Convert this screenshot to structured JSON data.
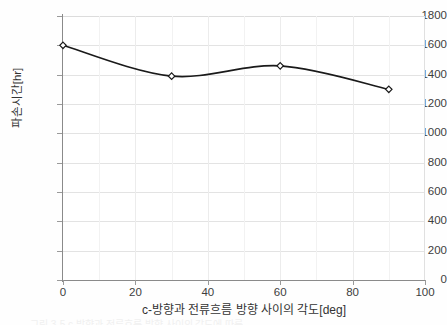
{
  "chart_data": {
    "type": "line",
    "title": "",
    "xlabel": "c-방향과 전류흐름 방향 사이의 각도[deg]",
    "ylabel": "파손시간[hr]",
    "x": [
      0,
      30,
      60,
      90
    ],
    "values": [
      1600,
      1390,
      1460,
      1300
    ],
    "series": [
      {
        "name": "파손시간",
        "values": [
          1600,
          1390,
          1460,
          1300
        ]
      }
    ],
    "xlim": [
      0,
      100
    ],
    "ylim": [
      0,
      1800
    ],
    "xticks": [
      0,
      20,
      40,
      60,
      80,
      100
    ],
    "yticks": [
      0,
      200,
      400,
      600,
      800,
      1000,
      1200,
      1400,
      1600,
      1800
    ],
    "xtick_labels": [
      "0",
      "20",
      "40",
      "60",
      "80",
      "100"
    ],
    "ytick_labels": [
      "0",
      "200",
      "400",
      "600",
      "800",
      "1000",
      "1200",
      "1400",
      "1600",
      "1800"
    ],
    "grid": true,
    "grid_minor_x_step": 10,
    "legend": null,
    "line_color": "#1a1a1a",
    "marker": "diamond-outline",
    "marker_fill": "#ffffff",
    "marker_edge": "#1a1a1a",
    "smoothed": true
  },
  "axes": {
    "y_title": "파손시간[hr]",
    "x_title": "c-방향과 전류흐름 방향 사이의 각도[deg]"
  },
  "colors": {
    "line": "#1a1a1a",
    "grid": "#e3e3e3",
    "grid_minor": "#f2f2f2",
    "axis": "#8a8a8a",
    "text": "#3d3d3d",
    "background": "#ffffff"
  },
  "caption": {
    "sliver_text": "그림 3-5 c-방향과 전류흐름 방향 사이의 각도에 따른"
  }
}
